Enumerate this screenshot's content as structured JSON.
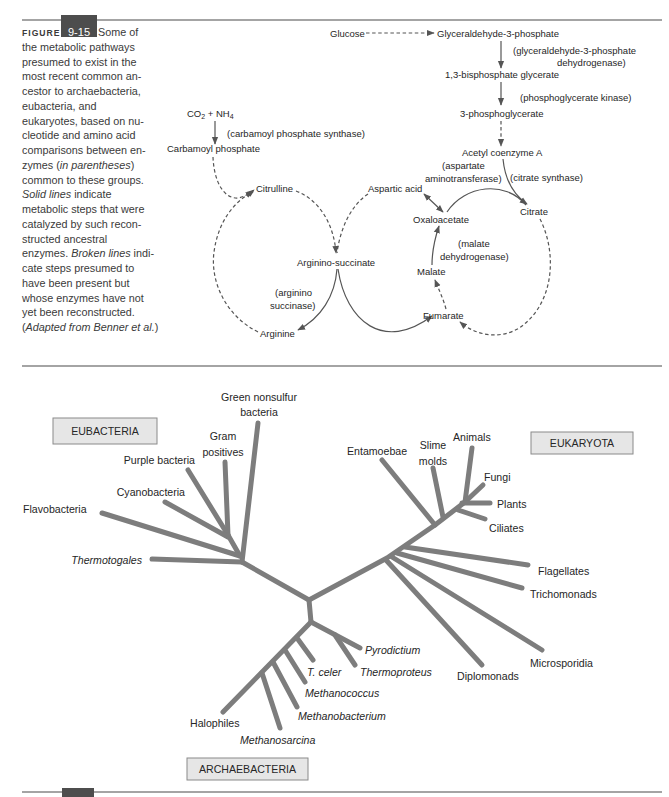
{
  "caption": {
    "figure_label": "FIGURE",
    "figure_number": "9-15",
    "lines": [
      [
        " Some of"
      ],
      [
        "the metabolic pathways"
      ],
      [
        "presumed to exist in the"
      ],
      [
        "most recent common an-"
      ],
      [
        "cestor to archaebacteria,"
      ],
      [
        "eubacteria, and"
      ],
      [
        "eukaryotes, based on nu-"
      ],
      [
        "cleotide and amino acid"
      ],
      [
        "comparisons between en-"
      ],
      [
        "zymes (",
        "in parentheses",
        ")"
      ],
      [
        "common to these groups."
      ],
      [
        "Solid lines",
        " indicate"
      ],
      [
        "metabolic steps that were"
      ],
      [
        "catalyzed by such recon-"
      ],
      [
        "structed ancestral"
      ],
      [
        "enzymes. ",
        "Broken lines",
        " indi-"
      ],
      [
        "cate steps presumed to"
      ],
      [
        "have been present but"
      ],
      [
        "whose enzymes have not"
      ],
      [
        "yet been reconstructed."
      ],
      [
        "(",
        "Adapted from Benner et al.",
        ")"
      ]
    ]
  },
  "pathways": {
    "glycolysis": {
      "glucose": "Glucose",
      "g3p": "Glyceraldehyde-3-phosphate",
      "g3pdh_line1": "(glyceraldehyde-3-phosphate",
      "g3pdh_line2": "dehydrogenase)",
      "bpg": "1,3-bisphosphate glycerate",
      "pgk": "(phosphoglycerate kinase)",
      "pg3": "3-phosphoglycerate",
      "acetyl_coa": "Acetyl coenzyme A"
    },
    "urea_cycle": {
      "co": "CO",
      "co_sub": "2",
      "plus_nh": " + NH",
      "nh_sub": "4",
      "cps": "(carbamoyl phosphate synthase)",
      "carbamoyl_phosphate": "Carbamoyl phosphate",
      "citrulline": "Citrulline",
      "aspartic_acid": "Aspartic acid",
      "argininosuccinate": "Arginino-succinate",
      "as_line1": "(arginino",
      "as_line2": "succinase)",
      "arginine": "Arginine"
    },
    "citric_cycle": {
      "asat_line1": "(aspartate",
      "asat_line2": "aminotransferase)",
      "citrate_synthase": "(citrate synthase)",
      "citrate": "Citrate",
      "oxaloacetate": "Oxaloacetate",
      "mdh_line1": "(malate",
      "mdh_line2": "dehydrogenase)",
      "malate": "Malate",
      "fumarate": "Fumarate"
    }
  },
  "tree": {
    "domains": {
      "eubacteria": "EUBACTERIA",
      "eukaryota": "EUKARYOTA",
      "archaebacteria": "ARCHAEBACTERIA"
    },
    "eubacteria": [
      {
        "lines": [
          "Green nonsulfur",
          "bacteria"
        ],
        "italic": false
      },
      {
        "lines": [
          "Gram",
          "positives"
        ],
        "italic": false
      },
      {
        "lines": [
          "Purple bacteria"
        ],
        "italic": false
      },
      {
        "lines": [
          "Cyanobacteria"
        ],
        "italic": false
      },
      {
        "lines": [
          "Flavobacteria"
        ],
        "italic": false
      },
      {
        "lines": [
          "Thermotogales"
        ],
        "italic": true
      }
    ],
    "eukaryota": [
      {
        "lines": [
          "Entamoebae"
        ],
        "italic": false
      },
      {
        "lines": [
          "Slime",
          "molds"
        ],
        "italic": false
      },
      {
        "lines": [
          "Animals"
        ],
        "italic": false
      },
      {
        "lines": [
          "Fungi"
        ],
        "italic": false
      },
      {
        "lines": [
          "Plants"
        ],
        "italic": false
      },
      {
        "lines": [
          "Ciliates"
        ],
        "italic": false
      },
      {
        "lines": [
          "Flagellates"
        ],
        "italic": false
      },
      {
        "lines": [
          "Trichomonads"
        ],
        "italic": false
      },
      {
        "lines": [
          "Microsporidia"
        ],
        "italic": false
      },
      {
        "lines": [
          "Diplomonads"
        ],
        "italic": false
      }
    ],
    "archaebacteria": [
      {
        "lines": [
          "Pyrodictium"
        ],
        "italic": true
      },
      {
        "lines": [
          "Thermoproteus"
        ],
        "italic": true
      },
      {
        "lines": [
          "T. celer"
        ],
        "italic": true
      },
      {
        "lines": [
          "Methanococcus"
        ],
        "italic": true
      },
      {
        "lines": [
          "Methanobacterium"
        ],
        "italic": true
      },
      {
        "lines": [
          "Halophiles"
        ],
        "italic": false
      },
      {
        "lines": [
          "Methanosarcina"
        ],
        "italic": true
      }
    ]
  },
  "colors": {
    "tree_branch": "#7d7d7d",
    "domain_box_fill": "#e6e6e6",
    "figure_tab": "#4d4d4d",
    "text": "#262626"
  }
}
